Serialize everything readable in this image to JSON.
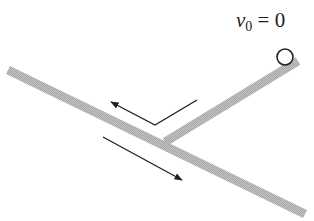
{
  "diagram": {
    "label": {
      "symbol": "v",
      "subscript": "0",
      "equals": " = ",
      "value": "0"
    },
    "colors": {
      "track": "#b8b8b8",
      "track_dark": "#a8a8a8",
      "arrow": "#222222",
      "ball_stroke": "#222222",
      "background": "#ffffff"
    },
    "elements": [
      {
        "type": "main-track",
        "from": [
          8,
          70
        ],
        "to": [
          305,
          214
        ]
      },
      {
        "type": "branch-track",
        "from": [
          165,
          142
        ],
        "to": [
          298,
          61
        ]
      },
      {
        "type": "ball",
        "center": [
          285,
          57
        ],
        "radius": 8
      },
      {
        "type": "arrow-up-left",
        "points": [
          [
            197,
            100
          ],
          [
            155,
            125
          ],
          [
            111,
            102
          ]
        ]
      },
      {
        "type": "arrow-down-right",
        "points": [
          [
            103,
            137
          ],
          [
            182,
            180
          ]
        ]
      }
    ]
  }
}
